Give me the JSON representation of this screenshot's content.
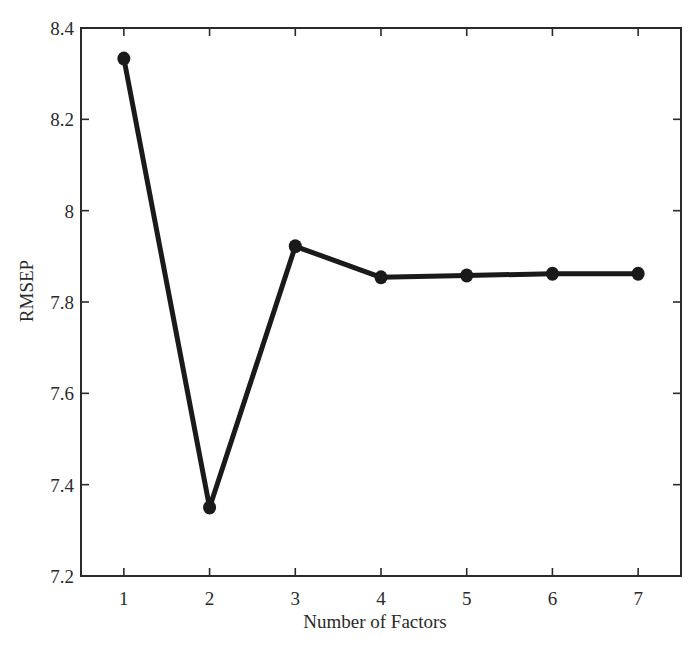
{
  "chart_data": {
    "type": "line",
    "title": "",
    "xlabel": "Number of Factors",
    "ylabel": "RMSEP",
    "x": [
      1,
      2,
      3,
      4,
      5,
      6,
      7
    ],
    "categories": [
      "1",
      "2",
      "3",
      "4",
      "5",
      "6",
      "7"
    ],
    "series": [
      {
        "name": "RMSEP",
        "values": [
          8.333,
          7.35,
          7.922,
          7.854,
          7.858,
          7.862,
          7.862
        ],
        "marker": "circle",
        "color": "#1a1a1a"
      }
    ],
    "xlim": [
      0.5,
      7.5
    ],
    "ylim": [
      7.2,
      8.4
    ],
    "xticks": [
      "1",
      "2",
      "3",
      "4",
      "5",
      "6",
      "7"
    ],
    "yticks": [
      "7.2",
      "7.4",
      "7.6",
      "7.8",
      "8",
      "8.2",
      "8.4"
    ],
    "grid": false,
    "legend": null
  },
  "colors": {
    "axis": "#2a2a2a",
    "line": "#1a1a1a",
    "background": "#ffffff"
  }
}
